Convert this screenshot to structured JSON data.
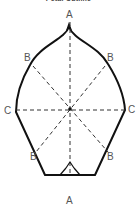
{
  "title": "Petal Outline",
  "colors": {
    "outline": "#111111",
    "guide": "#333333",
    "label": "#555555",
    "background": "#ffffff"
  },
  "labels": {
    "top": "A",
    "bottom": "A",
    "upper_left": "B",
    "upper_right": "B",
    "lower_left": "B",
    "lower_right": "B",
    "left": "C",
    "right": "C"
  }
}
